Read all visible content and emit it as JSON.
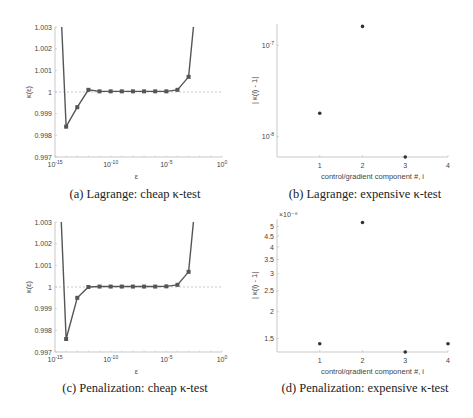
{
  "figures": [
    {
      "caption": "(a) Lagrange: cheap κ-test",
      "ylabel": "κ(ε)",
      "xlabel": "ε"
    },
    {
      "caption": "(b) Lagrange: expensive κ-test",
      "ylabel": "| κ(i) - 1|",
      "xlabel": "control/gradient component #, i"
    },
    {
      "caption": "(c) Penalization: cheap κ-test",
      "ylabel": "κ(ε)",
      "xlabel": "ε"
    },
    {
      "caption": "(d) Penalization: expensive κ-test",
      "ylabel": "| κ(i) - 1|",
      "xlabel": "control/gradient component #, i",
      "yscale_note": "×10⁻⁸"
    }
  ],
  "chart_data": [
    {
      "type": "line",
      "title": "(a) Lagrange: cheap κ-test",
      "xlabel": "ε",
      "ylabel": "κ(ε)",
      "xscale": "log",
      "xlim": [
        1e-15,
        1
      ],
      "ylim": [
        0.997,
        1.003
      ],
      "xticks": [
        "10^-15",
        "10^-10",
        "10^-5",
        "10^0"
      ],
      "yticks": [
        "0.997",
        "0.998",
        "0.999",
        "1",
        "1.001",
        "1.002",
        "1.003"
      ],
      "reference_line": {
        "y": 1,
        "style": "dashed"
      },
      "x": [
        1e-15,
        1e-14,
        1e-13,
        1e-12,
        1e-11,
        1e-10,
        1e-09,
        1e-08,
        1e-07,
        1e-06,
        1e-05,
        0.0001,
        0.001,
        0.01
      ],
      "values": [
        1.01,
        0.9984,
        0.9993,
        1.0001,
        1.00003,
        1.00003,
        1.00003,
        1.00003,
        1.00003,
        1.00003,
        1.00003,
        1.0001,
        1.0007,
        1.006
      ]
    },
    {
      "type": "scatter",
      "title": "(b) Lagrange: expensive κ-test",
      "xlabel": "control/gradient component #, i",
      "ylabel": "| κ(i) - 1|",
      "yscale": "log",
      "xlim": [
        0,
        4
      ],
      "xticks": [
        "1",
        "2",
        "3",
        "4"
      ],
      "yticks": [
        "10^-8",
        "10^-7"
      ],
      "x": [
        1,
        2,
        3
      ],
      "values": [
        1.8e-08,
        1.6e-07,
        6e-09
      ]
    },
    {
      "type": "line",
      "title": "(c) Penalization: cheap κ-test",
      "xlabel": "ε",
      "ylabel": "κ(ε)",
      "xscale": "log",
      "xlim": [
        1e-15,
        1
      ],
      "ylim": [
        0.997,
        1.003
      ],
      "xticks": [
        "10^-15",
        "10^-10",
        "10^-5",
        "10^0"
      ],
      "yticks": [
        "0.997",
        "0.998",
        "0.999",
        "1",
        "1.001",
        "1.002",
        "1.003"
      ],
      "reference_line": {
        "y": 1,
        "style": "dashed"
      },
      "x": [
        1e-15,
        1e-14,
        1e-13,
        1e-12,
        1e-11,
        1e-10,
        1e-09,
        1e-08,
        1e-07,
        1e-06,
        1e-05,
        0.0001,
        0.001,
        0.01
      ],
      "values": [
        1.01,
        0.9976,
        0.9995,
        1.0,
        1.00002,
        1.00002,
        1.00002,
        1.00002,
        1.00002,
        1.00002,
        1.00003,
        1.0001,
        1.0007,
        1.006
      ]
    },
    {
      "type": "scatter",
      "title": "(d) Penalization: expensive κ-test",
      "xlabel": "control/gradient component #, i",
      "ylabel": "| κ(i) - 1|",
      "yscale": "log",
      "yscale_multiplier": "×10^-8",
      "xlim": [
        0,
        4
      ],
      "xticks": [
        "1",
        "2",
        "3",
        "4"
      ],
      "yticks": [
        "1.5",
        "2",
        "2.5",
        "3",
        "3.5",
        "4",
        "4.5",
        "5"
      ],
      "x": [
        1,
        2,
        3,
        4
      ],
      "values": [
        1.42e-08,
        5.2e-08,
        1.3e-08,
        1.42e-08
      ]
    }
  ]
}
